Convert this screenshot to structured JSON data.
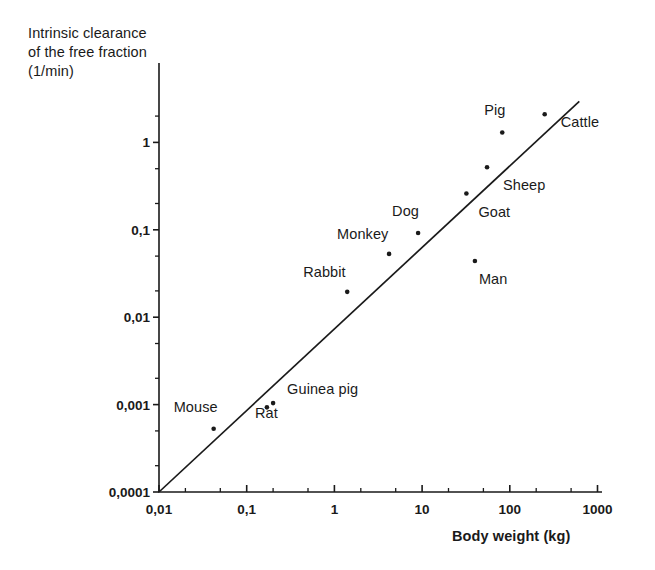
{
  "chart_data": {
    "type": "scatter",
    "title": "",
    "ylabel_lines": [
      "Intrinsic clearance",
      "of the free fraction",
      "(1/min)"
    ],
    "ylabel": "Intrinsic clearance of the free fraction (1/min)",
    "xlabel": "Body weight (kg)",
    "xscale": "log",
    "yscale": "log",
    "xlim": [
      0.01,
      1000
    ],
    "ylim": [
      0.0001,
      3
    ],
    "grid": false,
    "legend": "none",
    "xticks": [
      "0,01",
      "0,1",
      "1",
      "10",
      "100",
      "1000"
    ],
    "xtick_values": [
      0.01,
      0.1,
      1,
      10,
      100,
      1000
    ],
    "yticks": [
      "1",
      "0,1",
      "0,01",
      "0,001",
      "0,0001"
    ],
    "ytick_values": [
      1,
      0.1,
      0.01,
      0.001,
      0.0001
    ],
    "points": [
      {
        "label": "Mouse",
        "x": 0.042,
        "y": 0.00053,
        "label_dx": -40,
        "label_dy": -22
      },
      {
        "label": "Rat",
        "x": 0.17,
        "y": 0.00093,
        "label_dx": -12,
        "label_dy": 6
      },
      {
        "label": "Guinea pig",
        "x": 0.2,
        "y": 0.00104,
        "label_dx": 14,
        "label_dy": -14
      },
      {
        "label": "Rabbit",
        "x": 1.4,
        "y": 0.0195,
        "label_dx": -44,
        "label_dy": -20
      },
      {
        "label": "Monkey",
        "x": 4.2,
        "y": 0.053,
        "label_dx": -52,
        "label_dy": -20
      },
      {
        "label": "Dog",
        "x": 9.0,
        "y": 0.092,
        "label_dx": -26,
        "label_dy": -22
      },
      {
        "label": "Man",
        "x": 40,
        "y": 0.044,
        "label_dx": 4,
        "label_dy": 18
      },
      {
        "label": "Goat",
        "x": 32,
        "y": 0.26,
        "label_dx": 12,
        "label_dy": 18
      },
      {
        "label": "Sheep",
        "x": 55,
        "y": 0.52,
        "label_dx": 16,
        "label_dy": 18
      },
      {
        "label": "Pig",
        "x": 82,
        "y": 1.3,
        "label_dx": -18,
        "label_dy": -22
      },
      {
        "label": "Cattle",
        "x": 250,
        "y": 2.1,
        "label_dx": 16,
        "label_dy": 8
      }
    ],
    "trendline": {
      "label": "allometric regression line",
      "x_start": 0.01,
      "y_start": 0.0001,
      "x_end": 620,
      "y_end": 2.95
    },
    "colors": {
      "axis": "#1a1a1a",
      "marker": "#1a1a1a",
      "line": "#1a1a1a",
      "background": "#ffffff"
    }
  }
}
